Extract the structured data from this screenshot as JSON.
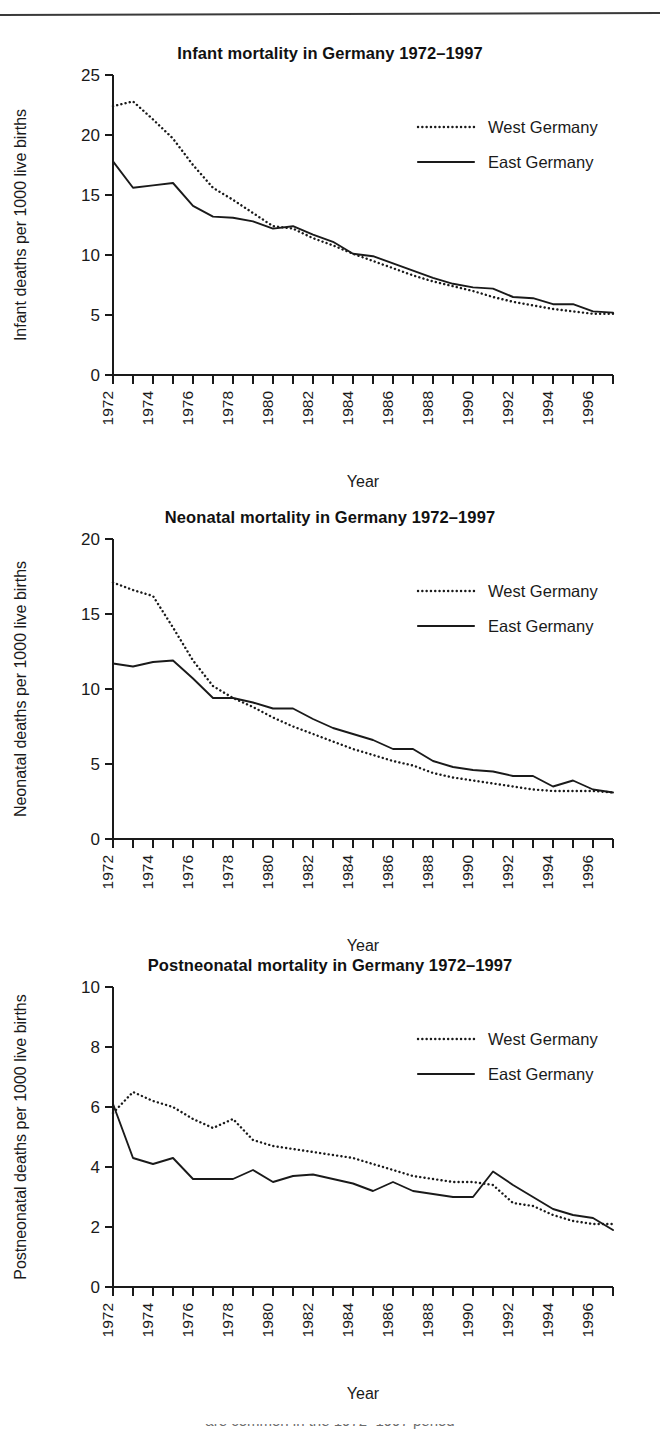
{
  "page": {
    "background": "#ffffff",
    "rule_color": "#3a3a3a",
    "ink_color": "#1a1a1a",
    "partial_bottom_text": "are common in the 1972–1997 period"
  },
  "legend": {
    "west_label": "West Germany",
    "east_label": "East Germany",
    "west_style": "dotted",
    "east_style": "solid"
  },
  "axis": {
    "x_title": "Year",
    "x_tick_labels": [
      "1972",
      "1974",
      "1976",
      "1978",
      "1980",
      "1982",
      "1984",
      "1986",
      "1988",
      "1990",
      "1992",
      "1994",
      "1996"
    ],
    "x_all_years": [
      1972,
      1973,
      1974,
      1975,
      1976,
      1977,
      1978,
      1979,
      1980,
      1981,
      1982,
      1983,
      1984,
      1985,
      1986,
      1987,
      1988,
      1989,
      1990,
      1991,
      1992,
      1993,
      1994,
      1995,
      1996,
      1997
    ]
  },
  "chart_data": [
    {
      "id": "infant",
      "type": "line",
      "title": "Infant mortality in Germany 1972–1997",
      "xlabel": "Year",
      "ylabel": "Infant deaths per 1000 live births",
      "ylim": [
        0,
        25
      ],
      "yticks": [
        0,
        5,
        10,
        15,
        20,
        25
      ],
      "ytick_labels": [
        "0",
        "5",
        "10",
        "15",
        "20",
        "25"
      ],
      "xlim": [
        1972,
        1997
      ],
      "grid": false,
      "legend_position": "top-right",
      "x": [
        1972,
        1973,
        1974,
        1975,
        1976,
        1977,
        1978,
        1979,
        1980,
        1981,
        1982,
        1983,
        1984,
        1985,
        1986,
        1987,
        1988,
        1989,
        1990,
        1991,
        1992,
        1993,
        1994,
        1995,
        1996,
        1997
      ],
      "series": [
        {
          "name": "West Germany",
          "style": "dotted",
          "values": [
            22.4,
            22.8,
            21.3,
            19.7,
            17.5,
            15.6,
            14.6,
            13.5,
            12.4,
            12.2,
            11.4,
            10.8,
            10.1,
            9.5,
            8.9,
            8.3,
            7.8,
            7.4,
            7.0,
            6.5,
            6.1,
            5.8,
            5.5,
            5.3,
            5.1,
            5.1
          ]
        },
        {
          "name": "East Germany",
          "style": "solid",
          "values": [
            17.8,
            15.6,
            15.8,
            16.0,
            14.1,
            13.2,
            13.1,
            12.8,
            12.2,
            12.4,
            11.7,
            11.1,
            10.1,
            9.9,
            9.3,
            8.7,
            8.1,
            7.6,
            7.3,
            7.2,
            6.5,
            6.4,
            5.9,
            5.9,
            5.3,
            5.2
          ]
        }
      ]
    },
    {
      "id": "neonatal",
      "type": "line",
      "title": "Neonatal mortality in Germany 1972–1997",
      "xlabel": "Year",
      "ylabel": "Neonatal deaths per 1000 live births",
      "ylim": [
        0,
        20
      ],
      "yticks": [
        0,
        5,
        10,
        15,
        20
      ],
      "ytick_labels": [
        "0",
        "5",
        "10",
        "15",
        "20"
      ],
      "xlim": [
        1972,
        1997
      ],
      "grid": false,
      "legend_position": "top-right",
      "x": [
        1972,
        1973,
        1974,
        1975,
        1976,
        1977,
        1978,
        1979,
        1980,
        1981,
        1982,
        1983,
        1984,
        1985,
        1986,
        1987,
        1988,
        1989,
        1990,
        1991,
        1992,
        1993,
        1994,
        1995,
        1996,
        1997
      ],
      "series": [
        {
          "name": "West Germany",
          "style": "dotted",
          "values": [
            17.1,
            16.6,
            16.2,
            14.1,
            11.9,
            10.2,
            9.4,
            8.8,
            8.1,
            7.5,
            7.0,
            6.5,
            6.0,
            5.6,
            5.2,
            4.9,
            4.4,
            4.1,
            3.9,
            3.7,
            3.5,
            3.3,
            3.2,
            3.2,
            3.2,
            3.1
          ]
        },
        {
          "name": "East Germany",
          "style": "solid",
          "values": [
            11.7,
            11.5,
            11.8,
            11.9,
            10.7,
            9.4,
            9.4,
            9.1,
            8.7,
            8.7,
            8.0,
            7.4,
            7.0,
            6.6,
            6.0,
            6.0,
            5.2,
            4.8,
            4.6,
            4.5,
            4.2,
            4.2,
            3.5,
            3.9,
            3.3,
            3.1
          ]
        }
      ]
    },
    {
      "id": "postneonatal",
      "type": "line",
      "title": "Postneonatal mortality in Germany 1972–1997",
      "xlabel": "Year",
      "ylabel": "Postneonatal deaths per 1000 live births",
      "ylim": [
        0,
        10
      ],
      "yticks": [
        0,
        2,
        4,
        6,
        8,
        10
      ],
      "ytick_labels": [
        "0",
        "2",
        "4",
        "6",
        "8",
        "10"
      ],
      "xlim": [
        1972,
        1997
      ],
      "grid": false,
      "legend_position": "top-right",
      "x": [
        1972,
        1973,
        1974,
        1975,
        1976,
        1977,
        1978,
        1979,
        1980,
        1981,
        1982,
        1983,
        1984,
        1985,
        1986,
        1987,
        1988,
        1989,
        1990,
        1991,
        1992,
        1993,
        1994,
        1995,
        1996,
        1997
      ],
      "series": [
        {
          "name": "West Germany",
          "style": "dotted",
          "values": [
            5.8,
            6.5,
            6.2,
            6.0,
            5.6,
            5.3,
            5.6,
            4.9,
            4.7,
            4.6,
            4.5,
            4.4,
            4.3,
            4.1,
            3.9,
            3.7,
            3.6,
            3.5,
            3.5,
            3.4,
            2.8,
            2.7,
            2.4,
            2.2,
            2.1,
            2.1
          ]
        },
        {
          "name": "East Germany",
          "style": "solid",
          "values": [
            6.1,
            4.3,
            4.1,
            4.3,
            3.6,
            3.6,
            3.6,
            3.9,
            3.5,
            3.7,
            3.75,
            3.6,
            3.45,
            3.2,
            3.5,
            3.2,
            3.1,
            3.0,
            3.0,
            3.85,
            3.4,
            3.0,
            2.6,
            2.4,
            2.3,
            1.9
          ]
        }
      ]
    }
  ]
}
